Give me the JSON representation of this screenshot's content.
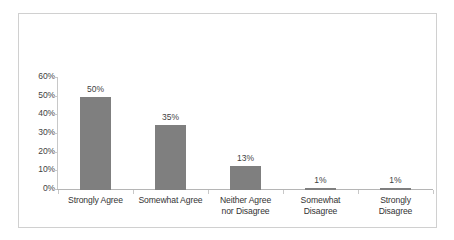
{
  "chart_data": {
    "type": "bar",
    "title": "",
    "subtitle": "",
    "xlabel": "",
    "ylabel": "",
    "categories": [
      "Strongly Agree",
      "Somewhat Agree",
      "Neither Agree nor Disagree",
      "Somewhat Disagree",
      "Strongly Disagree"
    ],
    "category_lines": [
      [
        "Strongly Agree"
      ],
      [
        "Somewhat Agree"
      ],
      [
        "Neither Agree",
        "nor Disagree"
      ],
      [
        "Somewhat",
        "Disagree"
      ],
      [
        "Strongly",
        "Disagree"
      ]
    ],
    "values": [
      50,
      35,
      13,
      1,
      1
    ],
    "data_labels": [
      "50%",
      "35%",
      "13%",
      "1%",
      "1%"
    ],
    "ylim": [
      0,
      60
    ],
    "ytick_values": [
      0,
      10,
      20,
      30,
      40,
      50,
      60
    ],
    "ytick_labels": [
      "0%",
      "10%",
      "20%",
      "30%",
      "40%",
      "50%",
      "60%"
    ],
    "grid": false,
    "legend": false,
    "legend_position": "none",
    "bar_color": "#7f7f7f",
    "axis_color": "#c8c8c8",
    "text_color": "#3f3f3f",
    "border_color": "#d0d0d0",
    "background_color": "#ffffff"
  }
}
